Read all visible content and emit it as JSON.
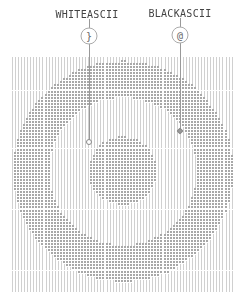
{
  "legend": [
    {
      "label": "WHITEASCII",
      "glyph": "}",
      "x": 89,
      "label_y": 9,
      "marker_y": 36,
      "line_top": 19,
      "line_bottom": 141,
      "point_y": 142,
      "kind": "white"
    },
    {
      "label": "BLACKASCII",
      "glyph": "@",
      "x": 180,
      "label_y": 8,
      "marker_y": 35,
      "line_top": 18,
      "line_bottom": 130,
      "point_y": 131,
      "kind": "black"
    }
  ],
  "art": {
    "grid": {
      "x0": 12,
      "y0": 58,
      "x1": 234,
      "y1": 290,
      "cell_w": 3.05,
      "cell_h": 3.05
    },
    "center": {
      "x": 123,
      "y": 171
    },
    "ring": {
      "outer_r": 110,
      "inner_r": 74
    },
    "disk": {
      "r": 34
    },
    "white_char": "|",
    "black_char": "@",
    "colors": {
      "white_ink": "#d0d0d0",
      "black_ink": "#a8a8a8"
    }
  }
}
